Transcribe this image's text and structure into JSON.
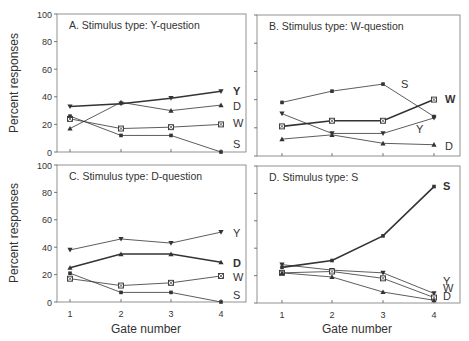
{
  "figure": {
    "ylabel": "Percent responses",
    "xlabel": "Gate number",
    "x_ticks": [
      "1",
      "2",
      "3",
      "4"
    ],
    "y_ticks": [
      "0",
      "20",
      "40",
      "60",
      "80",
      "100"
    ]
  },
  "chart_data": [
    {
      "type": "line",
      "title": "A. Stimulus type: Y-question",
      "xlabel": "Gate number",
      "ylabel": "Percent responses",
      "x": [
        1,
        2,
        3,
        4
      ],
      "ylim": [
        0,
        100
      ],
      "grid": false,
      "bold_series": "Y",
      "series": [
        {
          "name": "Y",
          "marker": "triangle-down",
          "values": [
            33,
            35,
            39,
            44
          ]
        },
        {
          "name": "D",
          "marker": "triangle-up",
          "values": [
            17,
            36,
            30,
            34
          ]
        },
        {
          "name": "W",
          "marker": "boxed-x",
          "values": [
            24,
            17,
            18,
            20
          ]
        },
        {
          "name": "S",
          "marker": "square",
          "values": [
            26,
            12,
            12,
            0
          ]
        }
      ]
    },
    {
      "type": "line",
      "title": "B. Stimulus type: W-question",
      "xlabel": "Gate number",
      "ylabel": "Percent responses",
      "x": [
        1,
        2,
        3,
        4
      ],
      "ylim": [
        0,
        100
      ],
      "grid": false,
      "bold_series": "W",
      "series": [
        {
          "name": "S",
          "marker": "square",
          "values": [
            38,
            46,
            51,
            28
          ]
        },
        {
          "name": "W",
          "marker": "boxed-x",
          "values": [
            21,
            25,
            25,
            40
          ]
        },
        {
          "name": "Y",
          "marker": "triangle-down",
          "values": [
            30,
            16,
            16,
            27
          ]
        },
        {
          "name": "D",
          "marker": "triangle-up",
          "values": [
            12,
            15,
            9,
            8
          ]
        }
      ]
    },
    {
      "type": "line",
      "title": "C. Stimulus type: D-question",
      "xlabel": "Gate number",
      "ylabel": "Percent responses",
      "x": [
        1,
        2,
        3,
        4
      ],
      "ylim": [
        0,
        100
      ],
      "grid": false,
      "bold_series": "D",
      "series": [
        {
          "name": "Y",
          "marker": "triangle-down",
          "values": [
            38,
            46,
            43,
            51
          ]
        },
        {
          "name": "D",
          "marker": "triangle-up",
          "values": [
            25,
            35,
            35,
            29
          ]
        },
        {
          "name": "W",
          "marker": "boxed-x",
          "values": [
            17,
            12,
            14,
            19
          ]
        },
        {
          "name": "S",
          "marker": "square",
          "values": [
            21,
            7,
            7,
            0
          ]
        }
      ]
    },
    {
      "type": "line",
      "title": "D. Stimulus type: S",
      "xlabel": "Gate number",
      "ylabel": "Percent responses",
      "x": [
        1,
        2,
        3,
        4
      ],
      "ylim": [
        0,
        100
      ],
      "grid": false,
      "bold_series": "S",
      "series": [
        {
          "name": "S",
          "marker": "square",
          "values": [
            26,
            31,
            49,
            85
          ]
        },
        {
          "name": "Y",
          "marker": "triangle-down",
          "values": [
            28,
            24,
            22,
            7
          ]
        },
        {
          "name": "W",
          "marker": "boxed-x",
          "values": [
            22,
            23,
            18,
            4
          ]
        },
        {
          "name": "D",
          "marker": "triangle-up",
          "values": [
            22,
            19,
            8,
            2
          ]
        }
      ]
    }
  ],
  "panels_layout": [
    {
      "left": 57,
      "right": 246,
      "top": 14,
      "bottom": 152,
      "xs": [
        70,
        121,
        171,
        221
      ],
      "show_y_ticklabels": true,
      "show_x_ticklabels": false,
      "labels": [
        {
          "text": "Y",
          "x": 233,
          "y": 95,
          "bold": true
        },
        {
          "text": "D",
          "x": 233,
          "y": 110,
          "bold": false
        },
        {
          "text": "W",
          "x": 233,
          "y": 127,
          "bold": false
        },
        {
          "text": "S",
          "x": 233,
          "y": 148,
          "bold": false
        }
      ]
    },
    {
      "left": 257,
      "right": 460,
      "top": 15,
      "bottom": 156,
      "xs": [
        282,
        332,
        383,
        434
      ],
      "show_y_ticklabels": false,
      "show_x_ticklabels": false,
      "labels": [
        {
          "text": "S",
          "x": 401,
          "y": 88,
          "bold": false
        },
        {
          "text": "W",
          "x": 445,
          "y": 103,
          "bold": true
        },
        {
          "text": "Y",
          "x": 416,
          "y": 133,
          "bold": false
        },
        {
          "text": "D",
          "x": 445,
          "y": 150,
          "bold": false
        }
      ]
    },
    {
      "left": 57,
      "right": 246,
      "top": 165,
      "bottom": 302,
      "xs": [
        70,
        121,
        171,
        221
      ],
      "show_y_ticklabels": true,
      "show_x_ticklabels": true,
      "labels": [
        {
          "text": "Y",
          "x": 233,
          "y": 237,
          "bold": false
        },
        {
          "text": "D",
          "x": 233,
          "y": 267,
          "bold": true
        },
        {
          "text": "W",
          "x": 233,
          "y": 281,
          "bold": false
        },
        {
          "text": "S",
          "x": 233,
          "y": 299,
          "bold": false
        }
      ]
    },
    {
      "left": 257,
      "right": 460,
      "top": 166,
      "bottom": 303,
      "xs": [
        282,
        332,
        383,
        434
      ],
      "show_y_ticklabels": false,
      "show_x_ticklabels": true,
      "labels": [
        {
          "text": "S",
          "x": 443,
          "y": 190,
          "bold": true
        },
        {
          "text": "Y",
          "x": 443,
          "y": 285,
          "bold": false
        },
        {
          "text": "W",
          "x": 443,
          "y": 292,
          "bold": false
        },
        {
          "text": "D",
          "x": 443,
          "y": 300,
          "bold": false
        }
      ]
    }
  ],
  "colors": {
    "axis": "#555555",
    "line": "#333333",
    "text": "#333333",
    "frame": "#777777"
  }
}
